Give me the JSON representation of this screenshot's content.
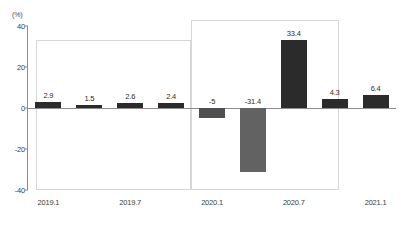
{
  "chart_data": {
    "type": "bar",
    "title": "",
    "xlabel": "",
    "ylabel": "(%)",
    "ylim": [
      -40,
      40
    ],
    "yticks": [
      40,
      20,
      0,
      -20,
      -40
    ],
    "grid": false,
    "legend": "none",
    "categories": [
      "2019.1",
      "2019.4",
      "2019.7",
      "2019.10",
      "2020.1",
      "2020.4",
      "2020.7",
      "2020.10",
      "2021.1"
    ],
    "values": [
      2.9,
      1.5,
      2.6,
      2.4,
      -5,
      -31.4,
      33.4,
      4.3,
      6.4
    ],
    "bar_labels": [
      "2.9",
      "1.5",
      "2.6",
      "2.4",
      "-5",
      "-31.4",
      "33.4",
      "4.3",
      "6.4"
    ],
    "bar_colors": [
      "#2b2b2b",
      "#2b2b2b",
      "#2b2b2b",
      "#2b2b2b",
      "#4f4f4f",
      "#626262",
      "#2b2b2b",
      "#2b2b2b",
      "#2b2b2b"
    ],
    "xticklabels": [
      "2019.1",
      "2019.7",
      "2020.1",
      "2020.7",
      "2021.1"
    ],
    "annotations": [
      "period-box-left",
      "period-box-right"
    ]
  },
  "axis": {
    "unit_label": "(%)",
    "yticks": [
      {
        "label": "40",
        "value": 40
      },
      {
        "label": "20",
        "value": 20
      },
      {
        "label": "0",
        "value": 0
      },
      {
        "label": "-20",
        "value": -20
      },
      {
        "label": "-40",
        "value": -40
      }
    ],
    "xticks": [
      {
        "label": "2019.1"
      },
      {
        "label": "2019.7"
      },
      {
        "label": "2020.1"
      },
      {
        "label": "2020.7"
      },
      {
        "label": "2021.1"
      }
    ]
  },
  "bars": [
    {
      "label": "2.9",
      "value": 2.9,
      "color": "#2b2b2b"
    },
    {
      "label": "1.5",
      "value": 1.5,
      "color": "#2b2b2b"
    },
    {
      "label": "2.6",
      "value": 2.6,
      "color": "#2b2b2b"
    },
    {
      "label": "2.4",
      "value": 2.4,
      "color": "#2b2b2b"
    },
    {
      "label": "-5",
      "value": -5,
      "color": "#4f4f4f"
    },
    {
      "label": "-31.4",
      "value": -31.4,
      "color": "#626262"
    },
    {
      "label": "33.4",
      "value": 33.4,
      "color": "#2b2b2b"
    },
    {
      "label": "4.3",
      "value": 4.3,
      "color": "#2b2b2b"
    },
    {
      "label": "6.4",
      "value": 6.4,
      "color": "#2b2b2b"
    }
  ],
  "footer": {
    "source_text": ""
  }
}
